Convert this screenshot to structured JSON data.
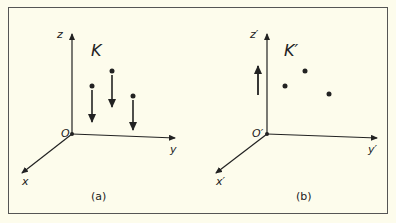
{
  "figure": {
    "panels": [
      {
        "id": "a",
        "caption": "(a)",
        "frame_label": "K",
        "axes": {
          "x": "x",
          "y": "y",
          "z": "z",
          "origin": "O"
        },
        "particles": 3,
        "arrows": "downward arrows beneath each particle"
      },
      {
        "id": "b",
        "caption": "(b)",
        "frame_label": "K′",
        "axes": {
          "x": "x′",
          "y": "y′",
          "z": "z′",
          "origin": "O′"
        },
        "particles": 3,
        "arrows": "single upward arrow left of particles"
      }
    ]
  }
}
